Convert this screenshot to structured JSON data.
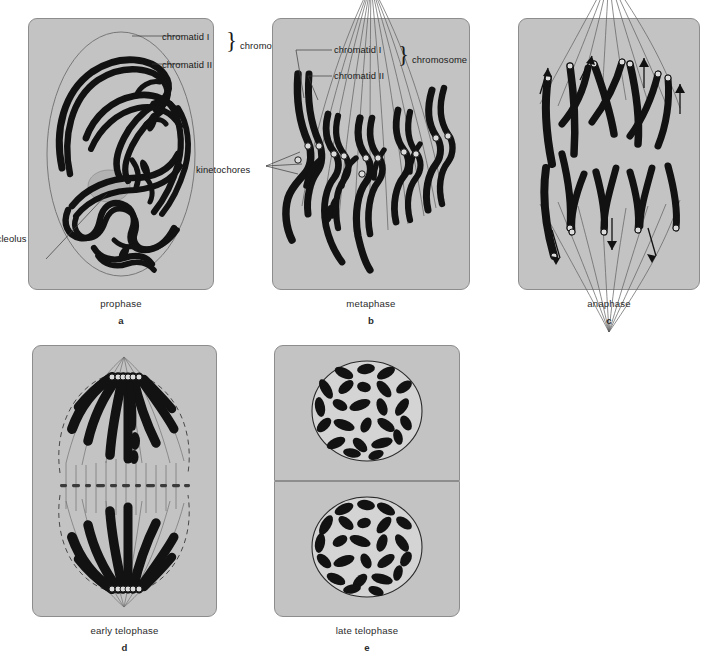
{
  "figure": {
    "background_color": "#ffffff",
    "panel_fill": "#c3c3c3",
    "chromatin_color": "#121212",
    "fiber_color": "#5d5d5d"
  },
  "panels": [
    {
      "id": "a",
      "letter": "a",
      "name": "prophase",
      "labels": [
        {
          "key": "chromatid_i",
          "text": "chromatid I"
        },
        {
          "key": "chromatid_ii",
          "text": "chromatid II"
        },
        {
          "key": "chromosome",
          "text": "chromosome"
        },
        {
          "key": "nucleolus",
          "text": "nucleolus"
        }
      ]
    },
    {
      "id": "b",
      "letter": "b",
      "name": "metaphase",
      "labels": [
        {
          "key": "chromatid_i",
          "text": "chromatid I"
        },
        {
          "key": "chromatid_ii",
          "text": "chromatid II"
        },
        {
          "key": "chromosome",
          "text": "chromosome"
        },
        {
          "key": "kinetochores",
          "text": "kinetochores"
        }
      ]
    },
    {
      "id": "c",
      "letter": "c",
      "name": "anaphase",
      "labels": []
    },
    {
      "id": "d",
      "letter": "d",
      "name": "early telophase",
      "labels": []
    },
    {
      "id": "e",
      "letter": "e",
      "name": "late telophase",
      "labels": []
    }
  ],
  "brace_glyph": "}"
}
